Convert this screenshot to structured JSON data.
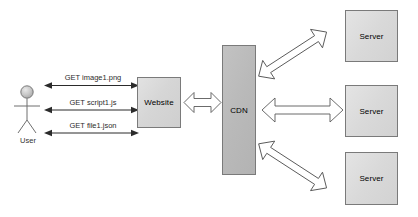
{
  "diagram": {
    "actor": {
      "name": "User",
      "icon": "stick-figure-icon"
    },
    "nodes": [
      {
        "id": "website",
        "label": "Website"
      },
      {
        "id": "cdn",
        "label": "CDN"
      },
      {
        "id": "server1",
        "label": "Server"
      },
      {
        "id": "server2",
        "label": "Server"
      },
      {
        "id": "server3",
        "label": "Server"
      }
    ],
    "request_edges": [
      {
        "id": "req-image",
        "label": "GET image1.png",
        "from": "User",
        "to": "Website"
      },
      {
        "id": "req-script",
        "label": "GET script1.js",
        "from": "User",
        "to": "Website"
      },
      {
        "id": "req-file",
        "label": "GET file1.json",
        "from": "User",
        "to": "Website"
      }
    ],
    "block_edges": [
      {
        "id": "website-cdn",
        "from": "Website",
        "to": "CDN",
        "direction": "bidirectional",
        "orientation": "horizontal"
      },
      {
        "id": "cdn-server1",
        "from": "CDN",
        "to": "Server",
        "direction": "bidirectional",
        "orientation": "diagonal-up"
      },
      {
        "id": "cdn-server2",
        "from": "CDN",
        "to": "Server",
        "direction": "bidirectional",
        "orientation": "horizontal"
      },
      {
        "id": "cdn-server3",
        "from": "CDN",
        "to": "Server",
        "direction": "bidirectional",
        "orientation": "diagonal-down"
      }
    ],
    "colors": {
      "background": "#ffffff",
      "website_fill": "#d8d8d8",
      "cdn_fill": "#bdbdbd",
      "server_fill": "#dcdcdc",
      "box_stroke": "#7a7a7a",
      "arrow_stroke": "#4a4a4a",
      "arrow_fill": "#ffffff",
      "text": "#333333"
    }
  }
}
